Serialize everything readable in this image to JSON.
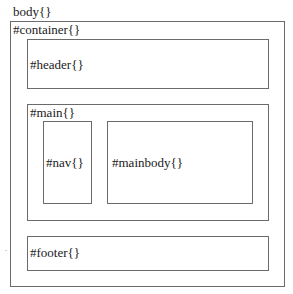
{
  "diagram": {
    "body_label": "body{}",
    "container_label": "#container{}",
    "header_label": "#header{}",
    "main_label": "#main{}",
    "nav_label": "#nav{}",
    "mainbody_label": "#mainbody{}",
    "footer_label": "#footer{}"
  },
  "colors": {
    "border": "#6a6a6a",
    "text": "#1a1a1a",
    "background": "#ffffff"
  }
}
